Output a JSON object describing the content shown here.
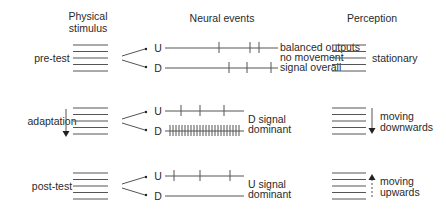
{
  "headers": {
    "stimulus": [
      "Physical",
      "stimulus"
    ],
    "neural": "Neural events",
    "perception": "Perception"
  },
  "rows": [
    {
      "label": "pre-test",
      "stimulus_arrow": "none",
      "u_label": "U",
      "d_label": "D",
      "u_spikes": [
        219,
        250,
        259
      ],
      "d_spikes": [
        229,
        247,
        271
      ],
      "d_dense": false,
      "neural_text": [
        "balanced outputs",
        "no movement",
        "signal overall"
      ],
      "perception_text": [
        "stationary"
      ],
      "perception_arrow": "none"
    },
    {
      "label": "adaptation",
      "stimulus_arrow": "down",
      "u_label": "U",
      "d_label": "D",
      "u_spikes": [
        181,
        200,
        224
      ],
      "d_spikes": "dense",
      "d_dense": true,
      "neural_text": [
        "D signal",
        "dominant"
      ],
      "perception_text": [
        "moving",
        "downwards"
      ],
      "perception_arrow": "down-solid"
    },
    {
      "label": "post-test",
      "stimulus_arrow": "none",
      "u_label": "U",
      "d_label": "D",
      "u_spikes": [
        174,
        200,
        230
      ],
      "d_spikes": [],
      "d_dense": false,
      "neural_text": [
        "U signal",
        "dominant"
      ],
      "perception_text": [
        "moving",
        "upwards"
      ],
      "perception_arrow": "up-dashed"
    }
  ],
  "colors": {
    "line": "#555555",
    "text": "#2a2a2a"
  }
}
